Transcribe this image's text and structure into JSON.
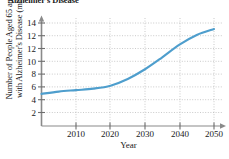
{
  "chart_data": {
    "type": "line",
    "title": "Alzheimer's Disease",
    "xlabel": "Year",
    "ylabel_line1": "Number of People Aged 65 and over",
    "ylabel_line2": "with Alzheimer's Disease (millions)",
    "xlim": [
      2000,
      2053
    ],
    "ylim": [
      0,
      15
    ],
    "xticks": [
      "2010",
      "2020",
      "2030",
      "2040",
      "2050"
    ],
    "xtick_values": [
      2010,
      2020,
      2030,
      2040,
      2050
    ],
    "yticks": [
      "2",
      "4",
      "6",
      "8",
      "10",
      "12",
      "14"
    ],
    "ytick_values": [
      2,
      4,
      6,
      8,
      10,
      12,
      14
    ],
    "grid": true,
    "grid_style": "dotted",
    "legend": "none",
    "series": [
      {
        "name": "People aged 65 and over with Alzheimer's Disease",
        "color": "#4e9ecd",
        "x": [
          2000,
          2005,
          2010,
          2015,
          2020,
          2025,
          2030,
          2035,
          2040,
          2045,
          2050
        ],
        "values": [
          4.5,
          4.8,
          5.0,
          5.2,
          5.6,
          6.5,
          7.8,
          9.4,
          11.1,
          12.4,
          13.2
        ]
      }
    ],
    "colors": {
      "line": "#4e9ecd",
      "axis": "#808080",
      "grid": "#b0b0b0",
      "text": "#1a1a1a"
    }
  }
}
